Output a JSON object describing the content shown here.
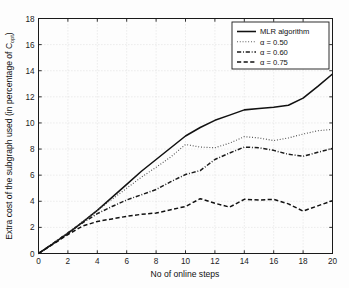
{
  "figure": {
    "background_color": "#fdfdfd",
    "axes_color": "#1a1a1a",
    "grid_color": "#c8c8c8"
  },
  "chart_data": {
    "type": "line",
    "title": "",
    "xlabel": "No of online steps",
    "ylabel": "Extra cost of the subgraph used (in percentage of C",
    "ylabel_subscript": "opt",
    "ylabel_suffix": ")",
    "xlim": [
      0,
      20
    ],
    "ylim": [
      0,
      18
    ],
    "xticks": [
      0,
      2,
      4,
      6,
      8,
      10,
      12,
      14,
      16,
      18,
      20
    ],
    "yticks": [
      0,
      2,
      4,
      6,
      8,
      10,
      12,
      14,
      16,
      18
    ],
    "grid": true,
    "grid_style": "dotted",
    "legend_position": "top-right",
    "x": [
      0,
      1,
      2,
      3,
      4,
      5,
      6,
      7,
      8,
      9,
      10,
      11,
      12,
      13,
      14,
      15,
      16,
      17,
      18,
      19,
      20
    ],
    "series": [
      {
        "name": "MLR algorithm",
        "style": "solid",
        "color": "#111111",
        "values": [
          0,
          0.75,
          1.55,
          2.4,
          3.3,
          4.3,
          5.3,
          6.3,
          7.2,
          8.1,
          9.0,
          9.65,
          10.2,
          10.6,
          11.0,
          11.1,
          11.2,
          11.35,
          11.9,
          12.8,
          13.75
        ]
      },
      {
        "name": "α = 0.50",
        "style": "dotted",
        "color": "#4a4a4a",
        "values": [
          0,
          0.8,
          1.6,
          2.45,
          3.3,
          4.15,
          5.0,
          5.85,
          6.6,
          7.4,
          8.35,
          8.15,
          8.1,
          8.45,
          8.95,
          8.85,
          8.65,
          8.85,
          9.15,
          9.4,
          9.5
        ]
      },
      {
        "name": "α = 0.60",
        "style": "dashdot",
        "color": "#1c1c1c",
        "values": [
          0,
          0.78,
          1.58,
          2.35,
          3.05,
          3.6,
          4.1,
          4.5,
          4.9,
          5.5,
          6.05,
          6.35,
          7.2,
          7.7,
          8.15,
          8.1,
          7.9,
          7.6,
          7.45,
          7.75,
          8.05
        ]
      },
      {
        "name": "α = 0.75",
        "style": "dashed",
        "color": "#111111",
        "values": [
          0,
          0.72,
          1.45,
          2.1,
          2.45,
          2.65,
          2.85,
          3.0,
          3.1,
          3.35,
          3.6,
          4.2,
          3.85,
          3.55,
          4.15,
          4.1,
          4.15,
          3.8,
          3.25,
          3.65,
          4.05
        ]
      }
    ]
  }
}
